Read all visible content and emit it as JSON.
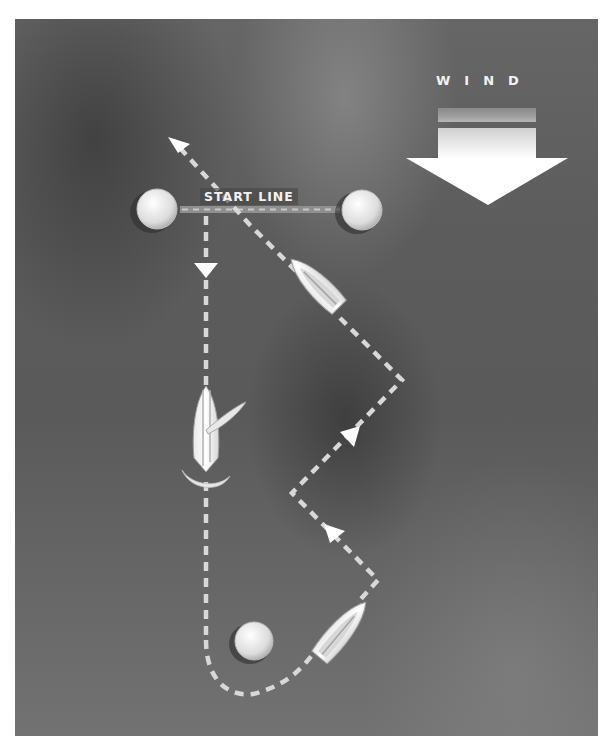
{
  "diagram": {
    "wind": {
      "label": "WIND",
      "direction": "down"
    },
    "start_line": {
      "label": "START LINE",
      "buoys": [
        {
          "name": "left-buoy",
          "x": 157,
          "y": 209
        },
        {
          "name": "right-buoy",
          "x": 362,
          "y": 210
        }
      ]
    },
    "mark_buoy": {
      "name": "bottom-mark",
      "x": 254,
      "y": 641
    },
    "boats": [
      {
        "name": "boat-upwind-tack",
        "x": 318,
        "y": 286,
        "heading": "upper-left"
      },
      {
        "name": "boat-luffing",
        "x": 206,
        "y": 432,
        "heading": "up"
      },
      {
        "name": "boat-rounding-mark",
        "x": 340,
        "y": 633,
        "heading": "upper-right"
      }
    ],
    "colors": {
      "water": "#5e5e5e",
      "path": "#d8d8d8",
      "arrow": "#ffffff",
      "buoy": "#e6e6e6"
    }
  }
}
